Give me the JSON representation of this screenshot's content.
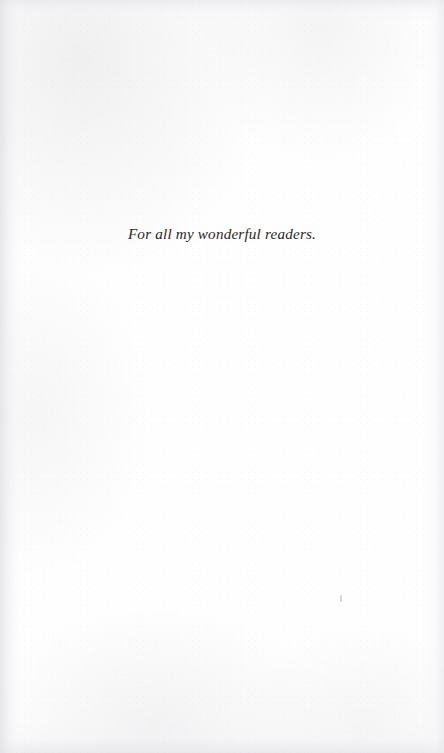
{
  "page": {
    "type": "book-dedication-page",
    "background_color": "#fefefe",
    "text_color": "#2b2825",
    "width": 444,
    "height": 753
  },
  "dedication": {
    "text": "For all my wonderful readers."
  },
  "artifacts": {
    "speck_label": ""
  }
}
